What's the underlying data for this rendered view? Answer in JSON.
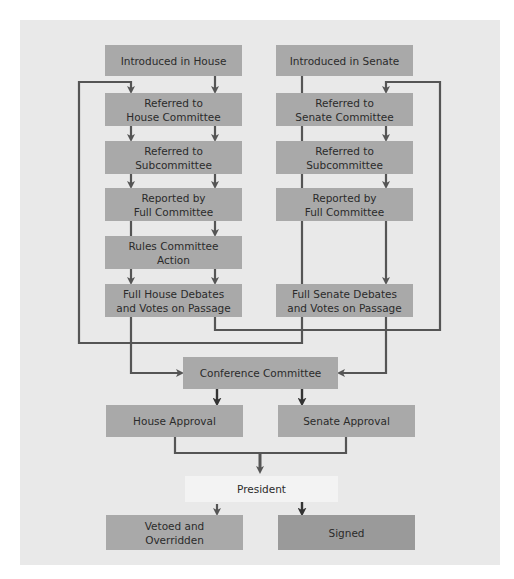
{
  "diagram": {
    "colors": {
      "background": "#e9e9e9",
      "box": "#a9a9a9",
      "signed_box": "#9a9a9a",
      "president_box": "#f3f3f3",
      "line": "#555555",
      "text": "#2b2b2b"
    },
    "house": {
      "introduced": "Introduced in House",
      "referred_committee": "Referred to\nHouse Committee",
      "referred_subcommittee": "Referred to\nSubcommittee",
      "reported": "Reported by\nFull Committee",
      "rules": "Rules Committee\nAction",
      "debates": "Full House Debates\nand Votes on Passage"
    },
    "senate": {
      "introduced": "Introduced in Senate",
      "referred_committee": "Referred to\nSenate Committee",
      "referred_subcommittee": "Referred to\nSubcommittee",
      "reported": "Reported by\nFull Committee",
      "debates": "Full Senate Debates\nand Votes on Passage"
    },
    "conference": "Conference Committee",
    "house_approval": "House Approval",
    "senate_approval": "Senate Approval",
    "president": "President",
    "vetoed": "Vetoed and\nOverridden",
    "signed": "Signed"
  }
}
